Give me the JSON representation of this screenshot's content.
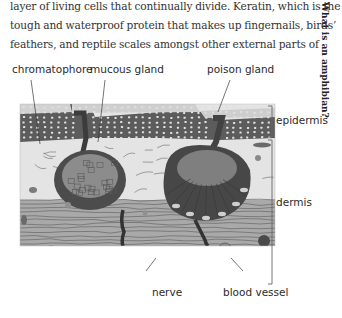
{
  "page": {
    "running_head": "What is an amphibian?",
    "body_lines": [
      "layer of living cells that continually divide. Keratin, which is the",
      "tough and waterproof protein that makes up fingernails, birds’",
      "feathers, and reptile scales amongst other external parts of"
    ]
  },
  "figure": {
    "labels": {
      "chromatophore": "chromatophore",
      "mucous_gland": "mucous gland",
      "poison_gland": "poison gland",
      "epidermis": "epidermis",
      "dermis": "dermis",
      "nerve": "nerve",
      "blood_vessel": "blood vessel"
    },
    "colors": {
      "epidermis_dark": "#5a5a5a",
      "epidermis_light": "#d4d4d4",
      "dermis_upper": "#e2e2e2",
      "dermis_lower": "#a8a8a8",
      "gland_dark": "#4a4a4a",
      "gland_cells": "#8a8a8a",
      "nerve": "#3a3a3a"
    }
  }
}
